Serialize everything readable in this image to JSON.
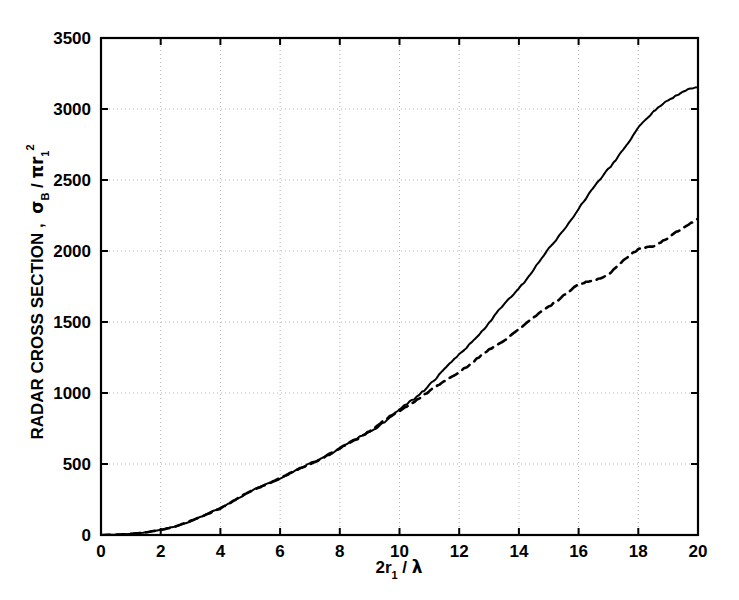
{
  "chart_data": {
    "type": "line",
    "title": "",
    "subtitle": "",
    "xlabel": "2r_1 / λ",
    "xlabel_parts": {
      "lead": "2r",
      "sub": "1",
      "slash": " / ",
      "sym": "λ"
    },
    "ylabel": "RADAR CROSS SECTION ,  σ_B / πr_1^2",
    "ylabel_parts": {
      "main": "RADAR CROSS SECTION ,",
      "sigma": "σ",
      "sigma_sub": "B",
      "slash": " / ",
      "pi_r": "πr",
      "r_sub": "1",
      "r_sup": "2"
    },
    "xlim": [
      0,
      20
    ],
    "ylim": [
      0,
      3500
    ],
    "xticks": [
      0,
      2,
      4,
      6,
      8,
      10,
      12,
      14,
      16,
      18,
      20
    ],
    "xtick_labels": [
      "0",
      "2",
      "4",
      "6",
      "8",
      "10",
      "12",
      "14",
      "16",
      "18",
      "20"
    ],
    "yticks": [
      0,
      500,
      1000,
      1500,
      2000,
      2500,
      3000,
      3500
    ],
    "ytick_labels": [
      "0",
      "500",
      "1000",
      "1500",
      "2000",
      "2500",
      "3000",
      "3500"
    ],
    "grid": true,
    "grid_style": "dotted",
    "grid_color": "#b4b4b4",
    "axis_color": "#000000",
    "legend": {
      "visible": false,
      "position": "none"
    },
    "series": [
      {
        "name": "solid-curve",
        "style": "solid",
        "color": "#000000",
        "linewidth": 2.0,
        "x": [
          0.0,
          0.5,
          1.0,
          1.5,
          2.0,
          2.5,
          3.0,
          3.5,
          4.0,
          4.5,
          5.0,
          5.5,
          6.0,
          6.5,
          7.0,
          7.5,
          8.0,
          8.5,
          9.0,
          9.5,
          10.0,
          10.5,
          11.0,
          11.5,
          12.0,
          12.5,
          13.0,
          13.5,
          14.0,
          14.5,
          15.0,
          15.5,
          16.0,
          16.5,
          17.0,
          17.5,
          18.0,
          18.5,
          19.0,
          19.5,
          20.0
        ],
        "y": [
          0,
          2,
          8,
          18,
          35,
          62,
          98,
          140,
          190,
          248,
          305,
          355,
          400,
          450,
          500,
          553,
          608,
          668,
          730,
          800,
          880,
          960,
          1060,
          1160,
          1270,
          1380,
          1490,
          1620,
          1740,
          1870,
          2010,
          2150,
          2300,
          2440,
          2580,
          2720,
          2860,
          2980,
          3070,
          3120,
          3150
        ]
      },
      {
        "name": "dashed-curve",
        "style": "dashed",
        "color": "#000000",
        "linewidth": 2.6,
        "dasharray": "9,6",
        "x": [
          0.0,
          0.5,
          1.0,
          1.5,
          2.0,
          2.5,
          3.0,
          3.5,
          4.0,
          4.5,
          5.0,
          5.5,
          6.0,
          6.5,
          7.0,
          7.5,
          8.0,
          8.5,
          9.0,
          9.5,
          10.0,
          10.5,
          11.0,
          11.5,
          12.0,
          12.5,
          13.0,
          13.5,
          14.0,
          14.5,
          15.0,
          15.5,
          16.0,
          16.5,
          17.0,
          17.5,
          18.0,
          18.5,
          19.0,
          19.5,
          20.0
        ],
        "y": [
          0,
          2,
          8,
          18,
          35,
          62,
          98,
          140,
          190,
          248,
          305,
          355,
          400,
          450,
          500,
          553,
          608,
          668,
          735,
          805,
          875,
          945,
          1010,
          1080,
          1150,
          1225,
          1300,
          1375,
          1450,
          1530,
          1610,
          1690,
          1760,
          1790,
          1840,
          1930,
          2010,
          2040,
          2090,
          2160,
          2230
        ]
      }
    ],
    "annotations": []
  }
}
